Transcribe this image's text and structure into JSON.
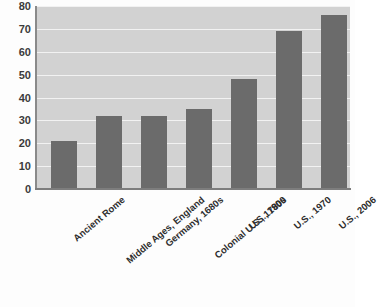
{
  "chart_data": {
    "type": "bar",
    "title": "",
    "subtitle": "",
    "xlabel": "",
    "ylabel": "",
    "categories": [
      "Ancient Rome",
      "Middle Ages, England",
      "Germany, 1680s",
      "Colonial U.S., 1780s",
      "U.S., 1900",
      "U.S., 1970",
      "U.S., 2006"
    ],
    "values": [
      21,
      32,
      32,
      35,
      48,
      69,
      76
    ],
    "ylim": [
      0,
      80
    ],
    "ytick_labels": [
      "0",
      "10",
      "20",
      "30",
      "40",
      "50",
      "60",
      "70",
      "80"
    ],
    "yticks": [
      0,
      10,
      20,
      30,
      40,
      50,
      60,
      70,
      80
    ],
    "grid": true,
    "legend": null,
    "legend_position": "none",
    "bar_color": "#6b6b6b",
    "plot_background": "#d2d2d2",
    "gridline_color": "#f2f2f2",
    "axis_color": "#7d7d7d",
    "tick_label_color": "#3b3b3b",
    "x_label_rotation": -40
  }
}
